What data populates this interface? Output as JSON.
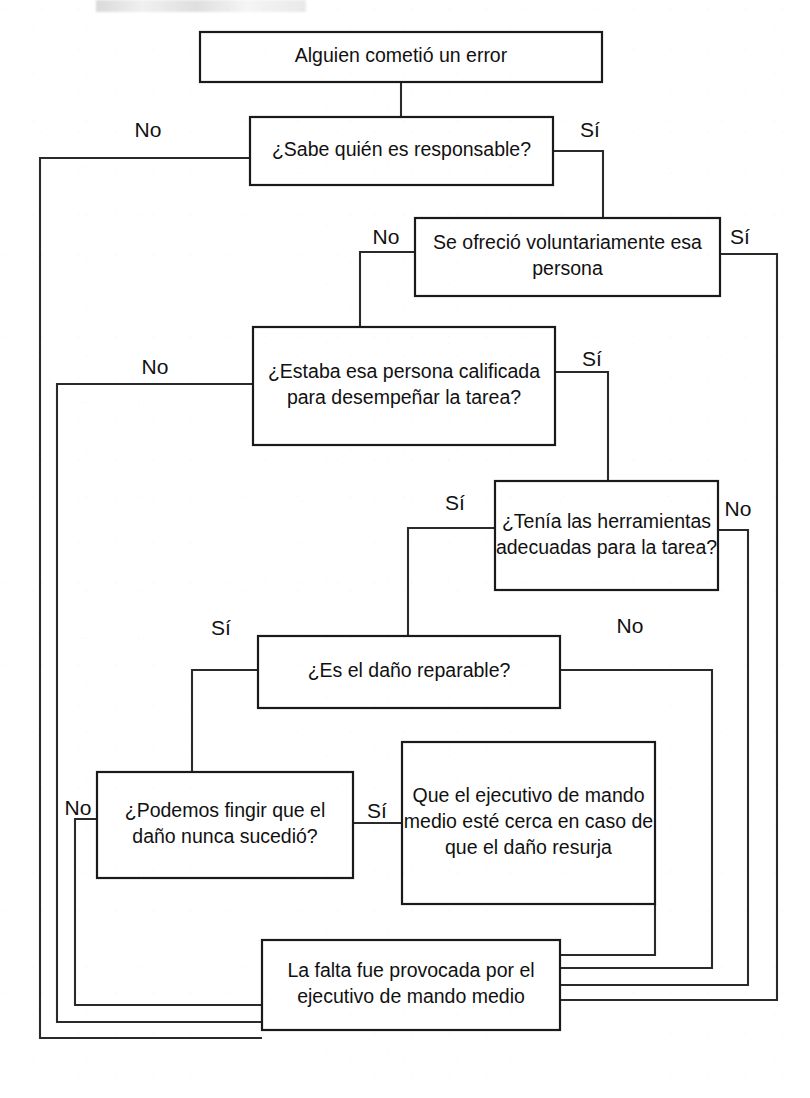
{
  "document": {
    "title_fragment": "",
    "language": "es"
  },
  "chart_data": {
    "type": "diagram",
    "diagram_kind": "decision-flowchart",
    "title": "Alguien cometió un error",
    "orientation": "top-to-bottom",
    "nodes": [
      {
        "id": "n1",
        "kind": "start",
        "lines": [
          "Alguien cometió un error"
        ],
        "x": 200,
        "y": 32,
        "w": 402,
        "h": 50
      },
      {
        "id": "n2",
        "kind": "decision",
        "lines": [
          "¿Sabe quién es responsable?"
        ],
        "x": 250,
        "y": 117,
        "w": 303,
        "h": 68
      },
      {
        "id": "n3",
        "kind": "decision",
        "lines": [
          "Se ofreció voluntariamente esa",
          "persona"
        ],
        "x": 415,
        "y": 218,
        "w": 305,
        "h": 78
      },
      {
        "id": "n4",
        "kind": "decision",
        "lines": [
          "¿Estaba esa persona calificada",
          "para desempeñar la tarea?"
        ],
        "x": 253,
        "y": 327,
        "w": 302,
        "h": 118
      },
      {
        "id": "n5",
        "kind": "decision",
        "lines": [
          "¿Tenía las herramientas",
          "adecuadas para la tarea?"
        ],
        "x": 495,
        "y": 481,
        "w": 223,
        "h": 109
      },
      {
        "id": "n6",
        "kind": "decision",
        "lines": [
          "¿Es el daño reparable?"
        ],
        "x": 258,
        "y": 636,
        "w": 302,
        "h": 72
      },
      {
        "id": "n7",
        "kind": "decision",
        "lines": [
          "¿Podemos fingir que el",
          "daño nunca sucedió?"
        ],
        "x": 97,
        "y": 772,
        "w": 256,
        "h": 106
      },
      {
        "id": "n8",
        "kind": "outcome",
        "lines": [
          "Que el ejecutivo de mando",
          "medio esté cerca en caso de",
          "que el daño resurja"
        ],
        "x": 402,
        "y": 742,
        "w": 253,
        "h": 162
      },
      {
        "id": "n9",
        "kind": "outcome",
        "lines": [
          "La falta fue provocada por el",
          "ejecutivo de mando medio"
        ],
        "x": 262,
        "y": 940,
        "w": 298,
        "h": 90
      }
    ],
    "edges": [
      {
        "id": "e0",
        "from": "n1",
        "to": "n2",
        "label": "",
        "path": "M 401 82 L 401 117"
      },
      {
        "id": "e1",
        "from": "n2",
        "to": "n9",
        "label": "No",
        "label_x": 148,
        "label_y": 131,
        "path": "M 250 158 L 40 158 L 40 1038 L 262 1038"
      },
      {
        "id": "e2",
        "from": "n2",
        "to": "n3",
        "label": "Sí",
        "label_x": 590,
        "label_y": 131,
        "path": "M 553 151 L 603 151 L 603 218"
      },
      {
        "id": "e3",
        "from": "n3",
        "to": "n4",
        "label": "No",
        "label_x": 386,
        "label_y": 238,
        "path": "M 415 252 L 360 252 L 360 327"
      },
      {
        "id": "e4",
        "from": "n3",
        "to": "n9",
        "label": "Sí",
        "label_x": 740,
        "label_y": 238,
        "path": "M 720 254 L 777 254 L 777 1000 L 560 1000"
      },
      {
        "id": "e5",
        "from": "n4",
        "to": "n9",
        "label": "No",
        "label_x": 155,
        "label_y": 368,
        "path": "M 253 384 L 57 384 L 57 1022 L 262 1022"
      },
      {
        "id": "e6",
        "from": "n4",
        "to": "n5",
        "label": "Sí",
        "label_x": 592,
        "label_y": 360,
        "path": "M 555 372 L 608 372 L 608 481"
      },
      {
        "id": "e7",
        "from": "n5",
        "to": "n6",
        "label": "Sí",
        "label_x": 455,
        "label_y": 504,
        "path": "M 495 528 L 408 528 L 408 636"
      },
      {
        "id": "e8",
        "from": "n5",
        "to": "n9",
        "label": "No",
        "label_x": 738,
        "label_y": 510,
        "path": "M 718 530 L 748 530 L 748 985 L 560 985"
      },
      {
        "id": "e9",
        "from": "n6",
        "to": "n7",
        "label": "Sí",
        "label_x": 221,
        "label_y": 629,
        "path": "M 258 670 L 192 670 L 192 772"
      },
      {
        "id": "e10",
        "from": "n6",
        "to": "n9",
        "label": "No",
        "label_x": 630,
        "label_y": 627,
        "path": "M 560 670 L 712 670 L 712 968 L 560 968"
      },
      {
        "id": "e11",
        "from": "n7",
        "to": "n9",
        "label": "No",
        "label_x": 78,
        "label_y": 809,
        "path": "M 97 819 L 75 819 L 75 1005 L 262 1005"
      },
      {
        "id": "e12",
        "from": "n7",
        "to": "n8",
        "label": "Sí",
        "label_x": 377,
        "label_y": 812,
        "path": "M 353 823 L 402 823"
      },
      {
        "id": "e13",
        "from": "n8",
        "to": "n9",
        "label": "",
        "path": "M 560 955 L 655 955 L 655 904"
      }
    ],
    "edge_labels_unique": [
      "No",
      "Sí"
    ],
    "colors": {
      "background": "#ffffff",
      "node_stroke": "#1a1a1a",
      "connector_stroke": "#2a2a2a",
      "text": "#111111"
    }
  }
}
